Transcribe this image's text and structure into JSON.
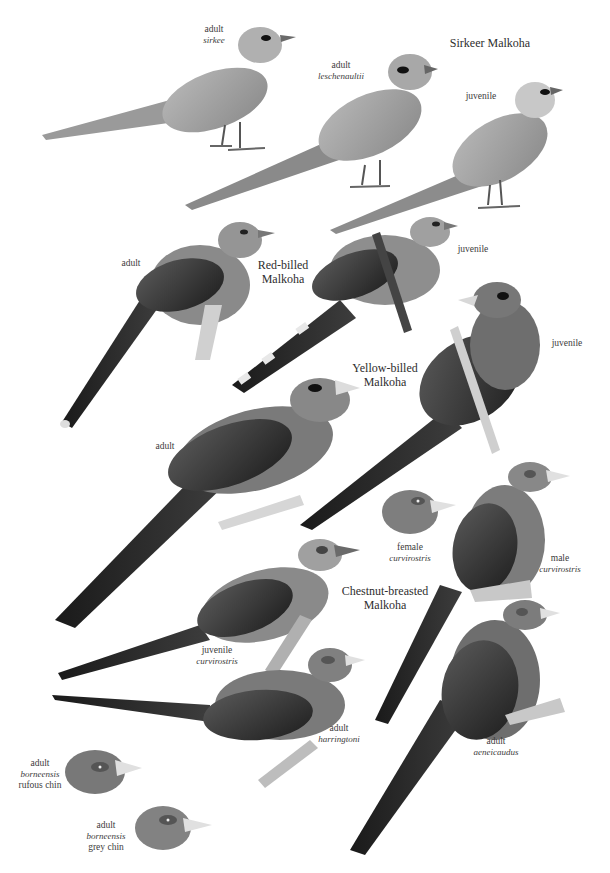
{
  "plate": {
    "species": [
      {
        "id": "sirkeer",
        "name_lines": [
          "Sirkeer Malkoha"
        ]
      },
      {
        "id": "red-billed",
        "name_lines": [
          "Red-billed",
          "Malkoha"
        ]
      },
      {
        "id": "yellow-billed",
        "name_lines": [
          "Yellow-billed",
          "Malkoha"
        ]
      },
      {
        "id": "chestnut-breasted",
        "name_lines": [
          "Chestnut-breasted",
          "Malkoha"
        ]
      }
    ],
    "labels": [
      {
        "id": "sirkeer-adult-sirkee",
        "roman": "adult",
        "italic": "sirkee"
      },
      {
        "id": "sirkeer-adult-leschenaultii",
        "roman": "adult",
        "italic": "leschenaultii"
      },
      {
        "id": "sirkeer-juvenile",
        "roman": "juvenile",
        "italic": ""
      },
      {
        "id": "red-billed-adult",
        "roman": "adult",
        "italic": ""
      },
      {
        "id": "red-billed-juvenile",
        "roman": "juvenile",
        "italic": ""
      },
      {
        "id": "yellow-billed-juvenile",
        "roman": "juvenile",
        "italic": ""
      },
      {
        "id": "yellow-billed-adult",
        "roman": "adult",
        "italic": ""
      },
      {
        "id": "chestnut-female-curvirostris",
        "roman": "female",
        "italic": "curvirostris"
      },
      {
        "id": "chestnut-male-curvirostris",
        "roman": "male",
        "italic": "curvirostris"
      },
      {
        "id": "chestnut-juvenile-curvirostris",
        "roman": "juvenile",
        "italic": "curvirostris"
      },
      {
        "id": "chestnut-adult-harringtoni",
        "roman": "adult",
        "italic": "harringtoni"
      },
      {
        "id": "chestnut-adult-aeneicaudus",
        "roman": "adult",
        "italic": "aeneicaudus"
      },
      {
        "id": "chestnut-adult-borneensis-rufous",
        "roman": "adult",
        "italic": "borneensis",
        "extra": "rufous chin"
      },
      {
        "id": "chestnut-adult-borneensis-grey",
        "roman": "adult",
        "italic": "borneensis",
        "extra": "grey chin"
      }
    ]
  }
}
